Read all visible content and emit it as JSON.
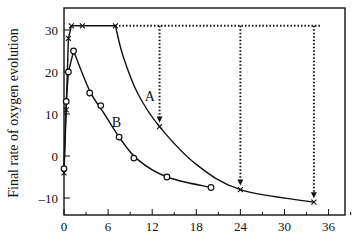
{
  "chart_data": {
    "type": "line",
    "title": "",
    "xlabel": "",
    "ylabel": "Final rate of oxygen evolution",
    "xlim": [
      0,
      38
    ],
    "ylim": [
      -12,
      35
    ],
    "xticks": [
      0,
      6,
      12,
      18,
      24,
      30,
      36
    ],
    "xtick_labels": [
      "0",
      "6",
      "12",
      "18",
      "24",
      "30",
      "36"
    ],
    "yticks": [
      -10,
      0,
      10,
      20,
      30
    ],
    "ytick_labels": [
      "–10",
      "0",
      "10",
      "20",
      "30"
    ],
    "grid": false,
    "legend": "none (curves labelled inline)",
    "series": [
      {
        "name": "A",
        "marker": "x",
        "x": [
          0,
          0.3,
          0.6,
          1,
          2.5,
          7,
          13,
          24,
          34
        ],
        "y": [
          -4,
          11,
          28,
          31,
          31,
          31,
          7,
          -8,
          -11
        ]
      },
      {
        "name": "B",
        "marker": "o",
        "x": [
          0,
          0.3,
          0.6,
          1.3,
          3.5,
          5,
          7.5,
          9.5,
          14,
          20
        ],
        "y": [
          -3,
          13,
          20,
          25,
          15,
          12,
          4.5,
          -0.5,
          -5,
          -7.5
        ]
      }
    ],
    "annotations": [
      {
        "type": "dotted-hline",
        "y": 31,
        "x_from": 7,
        "x_to": 35
      },
      {
        "type": "dotted-arrow-down",
        "x": 13,
        "y_from": 31,
        "y_to": 7
      },
      {
        "type": "dotted-arrow-down",
        "x": 24,
        "y_from": 31,
        "y_to": -8
      },
      {
        "type": "dotted-arrow-down",
        "x": 34,
        "y_from": 31,
        "y_to": -11
      },
      {
        "type": "label",
        "text": "A",
        "x": 11,
        "y": 13
      },
      {
        "type": "label",
        "text": "B",
        "x": 6.5,
        "y": 7
      }
    ]
  },
  "labels": {
    "curve_a": "A",
    "curve_b": "B",
    "y_axis": "Final rate of oxygen evolution"
  },
  "colors": {
    "ink": "#111111",
    "background": "#ffffff"
  }
}
